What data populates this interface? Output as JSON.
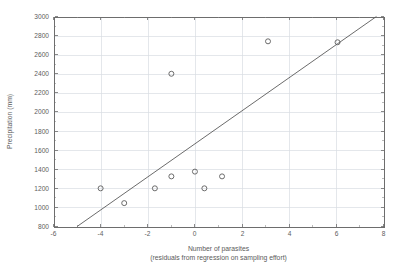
{
  "chart_data": {
    "type": "scatter",
    "title": "",
    "xlabel": "Number of parasites",
    "xlabel_sub": "(residuals from regression on sampling effort)",
    "ylabel": "Precipitation (mm)",
    "xlim": [
      -6,
      8
    ],
    "ylim": [
      800,
      3000
    ],
    "xticks": [
      -6,
      -4,
      -2,
      0,
      2,
      4,
      6,
      8
    ],
    "xtick_labels": [
      "-6",
      "-4",
      "-2",
      "0",
      "2",
      "4",
      "6",
      "8"
    ],
    "yticks": [
      800,
      1000,
      1200,
      1400,
      1600,
      1800,
      2000,
      2200,
      2400,
      2600,
      2800,
      3000
    ],
    "ytick_labels": [
      "800",
      "1000",
      "1200",
      "1400",
      "1600",
      "1800",
      "2000",
      "2200",
      "2400",
      "2600",
      "2800",
      "3000"
    ],
    "grid": true,
    "legend": "none",
    "marker": "open-circle",
    "points": [
      {
        "x": -4.0,
        "y": 1200
      },
      {
        "x": -3.0,
        "y": 1045
      },
      {
        "x": -1.7,
        "y": 1200
      },
      {
        "x": -1.0,
        "y": 2400
      },
      {
        "x": -1.0,
        "y": 1325
      },
      {
        "x": 0.0,
        "y": 1375
      },
      {
        "x": 0.4,
        "y": 1200
      },
      {
        "x": 1.15,
        "y": 1325
      },
      {
        "x": 3.1,
        "y": 2740
      },
      {
        "x": 6.05,
        "y": 2730
      }
    ],
    "series": [
      {
        "name": "regression-line",
        "type": "line",
        "x": [
          -5.0,
          7.7
        ],
        "y": [
          800,
          3000
        ]
      }
    ],
    "colors": {
      "marker_stroke": "#5c5c5c",
      "line": "#5a5a5a",
      "grid": "#d9dde3",
      "axis": "#6d6d6d",
      "text": "#5d5d5d",
      "background": "#ffffff"
    }
  }
}
